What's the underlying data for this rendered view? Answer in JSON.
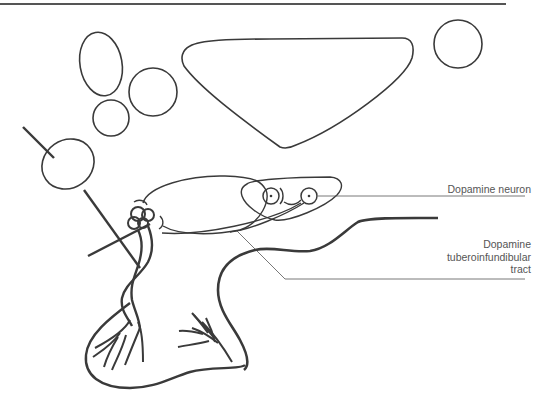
{
  "diagram": {
    "type": "anatomical-line-drawing",
    "labels": {
      "dopamine_neuron": "Dopamine neuron",
      "tract_line1": "Dopamine",
      "tract_line2": "tuberoinfundibular",
      "tract_line3": "tract"
    },
    "colors": {
      "stroke": "#3a3a3a",
      "leader_line": "#555555",
      "label_text": "#555555",
      "top_rule": "#555555",
      "background": "#ffffff"
    }
  }
}
